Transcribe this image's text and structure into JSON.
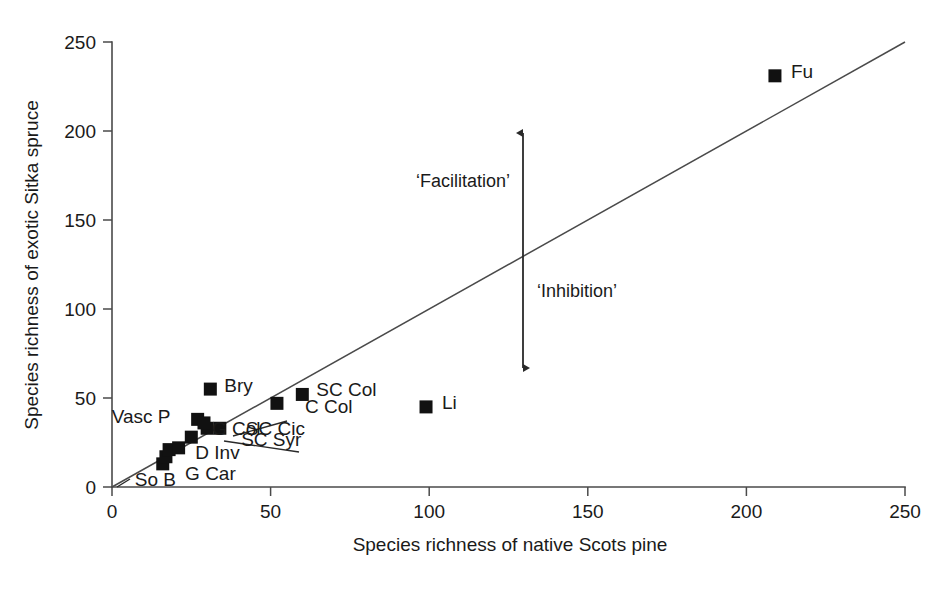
{
  "chart_data": {
    "type": "scatter",
    "title": "",
    "xlabel": "Species richness of native Scots pine",
    "ylabel": "Species richness of exotic Sitka spruce",
    "xlim": [
      0,
      250
    ],
    "ylim": [
      0,
      250
    ],
    "xticks": [
      0,
      50,
      100,
      150,
      200,
      250
    ],
    "yticks": [
      0,
      50,
      100,
      150,
      200,
      250
    ],
    "xticklabels": [
      "0",
      "50",
      "100",
      "150",
      "200",
      "250"
    ],
    "yticklabels": [
      "0",
      "50",
      "100",
      "150",
      "200",
      "250"
    ],
    "grid": false,
    "legend": null,
    "reference_line": {
      "name": "one-to-one-line",
      "x": [
        0,
        250
      ],
      "y": [
        0,
        250
      ],
      "description": "1:1 line"
    },
    "points": [
      {
        "label": "So B",
        "x": 16,
        "y": 13
      },
      {
        "label": "",
        "x": 17,
        "y": 17
      },
      {
        "label": "G Car",
        "x": 18,
        "y": 21
      },
      {
        "label": "",
        "x": 21,
        "y": 22
      },
      {
        "label": "D Inv",
        "x": 25,
        "y": 28
      },
      {
        "label": "Vasc P",
        "x": 27,
        "y": 38
      },
      {
        "label": "SC Syr",
        "x": 30,
        "y": 33
      },
      {
        "label": "G Col",
        "x": 29,
        "y": 36
      },
      {
        "label": "Bry",
        "x": 31,
        "y": 55
      },
      {
        "label": "SC Cic",
        "x": 34,
        "y": 33
      },
      {
        "label": "C Col",
        "x": 52,
        "y": 47
      },
      {
        "label": "SC Col",
        "x": 60,
        "y": 52
      },
      {
        "label": "Li",
        "x": 99,
        "y": 45
      },
      {
        "label": "Fu",
        "x": 209,
        "y": 231
      }
    ],
    "point_labels": [
      {
        "name": "label-bry",
        "text": "Bry",
        "x": 31,
        "y": 55,
        "dx": 14,
        "dy": 3
      },
      {
        "name": "label-vascp",
        "text": "Vasc P",
        "x": 27,
        "y": 38,
        "dx": -86,
        "dy": 4
      },
      {
        "name": "label-gcol",
        "text": "G Col",
        "x": 29,
        "y": 36,
        "dx": 8,
        "dy": 12
      },
      {
        "name": "label-sccol",
        "text": "SC Col",
        "x": 60,
        "y": 52,
        "dx": 14,
        "dy": 2
      },
      {
        "name": "label-ccol",
        "text": "C Col",
        "x": 52,
        "y": 47,
        "dx": 28,
        "dy": 10
      },
      {
        "name": "label-sccic",
        "text": "SC Cic",
        "x": 34,
        "y": 33,
        "dx": 26,
        "dy": 7
      },
      {
        "name": "label-scsyr",
        "text": "SC Syr",
        "x": 30,
        "y": 33,
        "dx": 34,
        "dy": 18
      },
      {
        "name": "label-dinv",
        "text": "D Inv",
        "x": 25,
        "y": 28,
        "dx": 4,
        "dy": 22
      },
      {
        "name": "label-gcar",
        "text": "G Car",
        "x": 18,
        "y": 21,
        "dx": 16,
        "dy": 30
      },
      {
        "name": "label-sob",
        "text": "So B",
        "x": 16,
        "y": 13,
        "dx": -28,
        "dy": 22
      },
      {
        "name": "label-li",
        "text": "Li",
        "x": 99,
        "y": 45,
        "dx": 16,
        "dy": 2
      },
      {
        "name": "label-fu",
        "text": "Fu",
        "x": 209,
        "y": 231,
        "dx": 16,
        "dy": 2
      }
    ],
    "annotations": [
      {
        "name": "facilitation-label",
        "text": "‘Facilitation’",
        "x": 110,
        "y": 172,
        "anchor": "end"
      },
      {
        "name": "inhibition-label",
        "text": "‘Inhibition’",
        "x": 136,
        "y": 108,
        "anchor": "start"
      },
      {
        "name": "facilitation-inhibition-arrow",
        "text": "",
        "type": "double-headed-vertical-arrow",
        "x": 129,
        "y_top": 198,
        "y_bottom": 66
      }
    ],
    "colors": {
      "marker": "#111111",
      "axis": "#4a4a4a",
      "line": "#4a4a4a",
      "text": "#1a1a1a",
      "background": "#ffffff"
    }
  },
  "axes": {
    "x_title": "Species richness of native Scots pine",
    "y_title": "Species richness of exotic Sitka spruce"
  }
}
